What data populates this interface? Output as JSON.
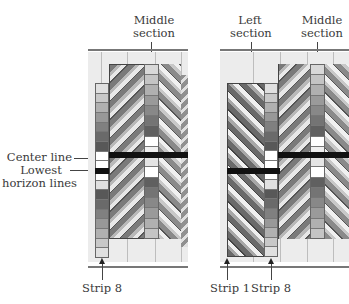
{
  "labels": {
    "left_middle_section": [
      "Middle",
      "section"
    ],
    "center_line": "Center line",
    "lowest_horizon": [
      "Lowest",
      "horizon lines"
    ],
    "left_strip8": "Strip 8",
    "right_left_section": [
      "Left",
      "section"
    ],
    "right_middle_section": [
      "Middle",
      "section"
    ],
    "right_strip1": "Strip 1",
    "right_strip8": "Strip 8"
  },
  "colors": {
    "background": "#ffffff",
    "panel_bg": "#ececec",
    "grid_line": "#bdbdbd",
    "horizon_bar": "#111111",
    "arrow": "#222222"
  },
  "strip_shades": [
    "#e0e0e0",
    "#c8c8c8",
    "#b0b0b0",
    "#989898",
    "#808080",
    "#6a6a6a",
    "#585858"
  ],
  "middle_strip_shades": [
    "#d8d8d8",
    "#c4c4c4",
    "#b0b0b0",
    "#9a9a9a",
    "#888888",
    "#747474",
    "#606060",
    "#ffffff",
    "#f0f0f0",
    "#e4e4e4"
  ]
}
